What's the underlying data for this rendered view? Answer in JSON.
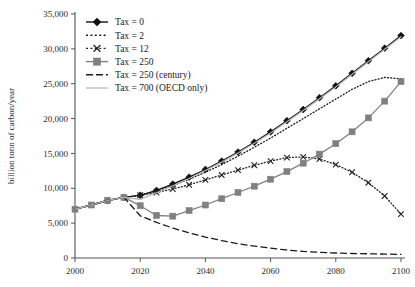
{
  "chart_data": {
    "type": "line",
    "title": "",
    "xlabel": "",
    "ylabel": "billion tonn of carbon/year",
    "xlim": [
      2000,
      2100
    ],
    "ylim": [
      0,
      35000
    ],
    "xticks": [
      "2000",
      "2020",
      "2040",
      "2060",
      "2080",
      "2100"
    ],
    "xtick_values": [
      2000,
      2020,
      2040,
      2060,
      2080,
      2100
    ],
    "yticks": [
      "0",
      "5,000",
      "10,000",
      "15,000",
      "20,000",
      "25,000",
      "30,000",
      "35,000"
    ],
    "ytick_values": [
      0,
      5000,
      10000,
      15000,
      20000,
      25000,
      30000,
      35000
    ],
    "grid": false,
    "legend_position": "top-left",
    "x": [
      2000,
      2005,
      2010,
      2015,
      2020,
      2025,
      2030,
      2035,
      2040,
      2045,
      2050,
      2055,
      2060,
      2065,
      2070,
      2075,
      2080,
      2085,
      2090,
      2095,
      2100
    ],
    "series": [
      {
        "name": "Tax = 0",
        "color": "#111111",
        "marker": "diamond",
        "dash": "solid",
        "values": [
          7000,
          7600,
          8250,
          8700,
          9000,
          9700,
          10600,
          11600,
          12700,
          13900,
          15200,
          16600,
          18100,
          19700,
          21300,
          23000,
          24700,
          26500,
          28300,
          30100,
          31900
        ]
      },
      {
        "name": "Tax = 2",
        "color": "#1a1a1a",
        "marker": "none",
        "dash": "dotted",
        "values": [
          7000,
          7600,
          8250,
          8700,
          9000,
          9600,
          10400,
          11300,
          12300,
          13400,
          14600,
          15900,
          17200,
          18600,
          20000,
          21400,
          22800,
          24200,
          25300,
          25900,
          25700
        ]
      },
      {
        "name": "Tax = 12",
        "color": "#222222",
        "marker": "x",
        "dash": "dotted",
        "values": [
          7000,
          7600,
          8250,
          8700,
          9000,
          9400,
          9900,
          10500,
          11200,
          11900,
          12600,
          13300,
          13900,
          14400,
          14500,
          14200,
          13400,
          12300,
          10800,
          8900,
          6300
        ]
      },
      {
        "name": "Tax = 250",
        "color": "#808080",
        "marker": "square",
        "dash": "solid",
        "values": [
          7000,
          7600,
          8250,
          8700,
          7500,
          6100,
          6000,
          6800,
          7600,
          8500,
          9400,
          10300,
          11300,
          12400,
          13600,
          14900,
          16400,
          18100,
          20100,
          22500,
          25300
        ]
      },
      {
        "name": "Tax = 250 (century)",
        "color": "#1a1a1a",
        "marker": "none",
        "dash": "dashed",
        "values": [
          7000,
          7600,
          8250,
          8700,
          6050,
          5100,
          4300,
          3600,
          3000,
          2500,
          2050,
          1700,
          1400,
          1150,
          950,
          820,
          720,
          650,
          600,
          560,
          520
        ]
      },
      {
        "name": "Tax = 700 (OECD only)",
        "color": "#b3b3b3",
        "marker": "none",
        "dash": "solid",
        "values": [
          7000,
          7600,
          8250,
          8700,
          8400,
          9350,
          10350,
          11400,
          12550,
          13750,
          15050,
          16450,
          17950,
          19550,
          21150,
          22850,
          24550,
          26350,
          28150,
          29950,
          31750
        ]
      }
    ]
  },
  "legend": {
    "items": [
      {
        "label": "Tax = 0"
      },
      {
        "label": "Tax = 2"
      },
      {
        "label": "Tax = 12"
      },
      {
        "label": "Tax = 250"
      },
      {
        "label": "Tax = 250 (century)"
      },
      {
        "label": "Tax = 700 (OECD only)"
      }
    ]
  }
}
